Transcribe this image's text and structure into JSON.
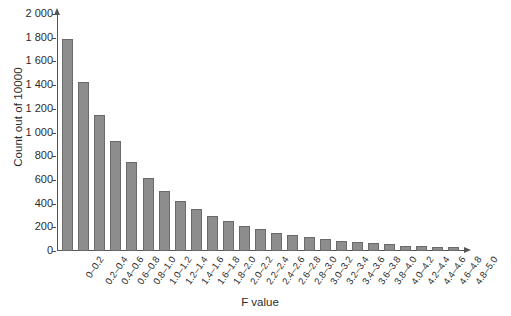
{
  "chart_data": {
    "type": "bar",
    "title": "",
    "xlabel": "F value",
    "ylabel": "Count out of 10000",
    "ylim": [
      0,
      2000
    ],
    "grid": false,
    "legend": "none",
    "bar_color": "#8d8d8d",
    "bar_edge_color": "#6a6a6a",
    "axis_color": "#555555",
    "ytick_labels": [
      "0",
      "200",
      "400",
      "600",
      "800",
      "1 000",
      "1 200",
      "1 400",
      "1 600",
      "1 800",
      "2 000"
    ],
    "ytick_values": [
      0,
      200,
      400,
      600,
      800,
      1000,
      1200,
      1400,
      1600,
      1800,
      2000
    ],
    "categories": [
      "0–0.2",
      "0.2–0.4",
      "0.4–0.6",
      "0.6–0.8",
      "0.8–1.0",
      "1.0–1.2",
      "1.2–1.4",
      "1.4–1.6",
      "1.6–1.8",
      "1.8–2.0",
      "2.0–2.2",
      "2.2–2.4",
      "2.4–2.6",
      "2.6–2.8",
      "2.8–3.0",
      "3.0–3.2",
      "3.2–3.4",
      "3.4–3.6",
      "3.6–3.8",
      "3.8–4.0",
      "4.0–4.2",
      "4.2–4.4",
      "4.4–4.6",
      "4.6–4.8",
      "4.8–5.0"
    ],
    "values": [
      1785,
      1425,
      1145,
      925,
      755,
      620,
      510,
      425,
      355,
      295,
      250,
      215,
      185,
      155,
      135,
      115,
      100,
      85,
      75,
      65,
      55,
      45,
      40,
      35,
      33
    ]
  }
}
